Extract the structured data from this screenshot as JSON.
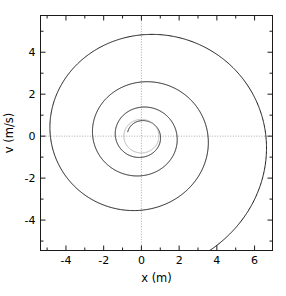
{
  "figure": {
    "background_color": "#ffffff",
    "width": 286,
    "height": 296
  },
  "chart_data": {
    "type": "line",
    "title": "",
    "subtitle": "",
    "xlabel": "x (m)",
    "ylabel": "v (m/s)",
    "xlim": [
      -5.35,
      6.95
    ],
    "ylim": [
      -5.45,
      5.75
    ],
    "xticks": [
      -4,
      -2,
      0,
      2,
      4,
      6
    ],
    "xtick_labels": [
      "-4",
      "-2",
      "0",
      "2",
      "4",
      "6"
    ],
    "yticks": [
      -4,
      -2,
      0,
      2,
      4
    ],
    "ytick_labels": [
      "-4",
      "-2",
      "0",
      "2",
      "4"
    ],
    "minor_tick_step": 1,
    "grid": "zero-lines-only",
    "grid_style": "dotted",
    "grid_color": "#aaaaaa",
    "legend": "none",
    "annotations": [],
    "series": [
      {
        "name": "damped-oscillator-trajectory",
        "color": "#1a1a1a",
        "linewidth": 1.0,
        "description": "Inward phase-space spiral of a damped harmonic oscillator, x versus v",
        "model": {
          "kind": "damped-spiral",
          "amplitude_start": 7.35,
          "decay_per_revolution": 0.535,
          "v_over_x_scale": 0.855,
          "phase_start_deg": -62,
          "turns": 3.62,
          "center": [
            0.0,
            0.0
          ]
        },
        "zero_crossings_right": [
          6.5,
          3.48,
          1.86,
          0.99
        ],
        "zero_crossings_left": [
          -4.75,
          -2.54,
          -1.36
        ],
        "v_maxima": [
          5.72,
          2.99,
          1.6
        ],
        "v_minima": [
          -4.08,
          -2.18,
          -1.17
        ]
      },
      {
        "name": "limit-cycle-circle",
        "color": "#b4b4b4",
        "linewidth": 1.0,
        "description": "Small light-gray circle near the origin marking the final limit cycle",
        "model": {
          "kind": "circle",
          "center": [
            0.0,
            0.0
          ],
          "radius_x": 0.93,
          "radius_v": 0.8
        }
      }
    ]
  },
  "axes": {
    "frame_color": "#1a1a1a",
    "frame_linewidth": 1.0,
    "tick_color": "#1a1a1a"
  }
}
